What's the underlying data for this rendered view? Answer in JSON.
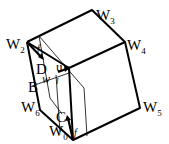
{
  "diagram": {
    "type": "cube-like polyhedron with inner section",
    "vertices": {
      "W0": {
        "label": "W",
        "sub": "0"
      },
      "W2": {
        "label": "W",
        "sub": "2"
      },
      "W3": {
        "label": "W",
        "sub": "3"
      },
      "W4": {
        "label": "W",
        "sub": "4"
      },
      "W5": {
        "label": "W",
        "sub": "5"
      },
      "W6": {
        "label": "W",
        "sub": "6"
      }
    },
    "points": {
      "B": "B",
      "C": "C",
      "D": "D"
    },
    "vectors": {
      "u": "u",
      "w": "w",
      "f_top": "f",
      "f_bottom": "f",
      "l": "l"
    }
  }
}
